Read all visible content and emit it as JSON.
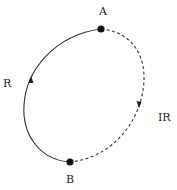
{
  "diagram": {
    "points": [
      {
        "id": "A",
        "label": "A"
      },
      {
        "id": "B",
        "label": "B"
      }
    ],
    "paths": [
      {
        "id": "R",
        "label": "R",
        "from": "B",
        "to": "A",
        "style": "solid",
        "side": "left"
      },
      {
        "id": "IR",
        "label": "IR",
        "from": "A",
        "to": "B",
        "style": "dashed",
        "side": "right"
      }
    ],
    "colors": {
      "stroke": "#333333",
      "dot": "#111111",
      "text": "#222222"
    }
  }
}
